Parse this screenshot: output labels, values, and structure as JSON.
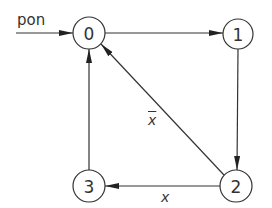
{
  "diagram": {
    "type": "state-transition",
    "colors": {
      "stroke": "#333333",
      "background": "#ffffff"
    },
    "entry": {
      "label": "pon",
      "target": "0"
    },
    "nodes": [
      {
        "id": "0",
        "label": "0",
        "cx": 89,
        "cy": 33,
        "r": 16
      },
      {
        "id": "1",
        "label": "1",
        "cx": 238,
        "cy": 34,
        "r": 15
      },
      {
        "id": "2",
        "label": "2",
        "cx": 236,
        "cy": 186,
        "r": 16
      },
      {
        "id": "3",
        "label": "3",
        "cx": 89,
        "cy": 186,
        "r": 16
      }
    ],
    "edges": [
      {
        "from": "0",
        "to": "1",
        "label": ""
      },
      {
        "from": "1",
        "to": "2",
        "label": ""
      },
      {
        "from": "2",
        "to": "0",
        "label": "x",
        "negated": true
      },
      {
        "from": "2",
        "to": "3",
        "label": "x",
        "negated": false
      },
      {
        "from": "3",
        "to": "0",
        "label": ""
      }
    ],
    "labels": {
      "entry": "pon",
      "edge_2_0": "x",
      "edge_2_3": "x"
    }
  }
}
